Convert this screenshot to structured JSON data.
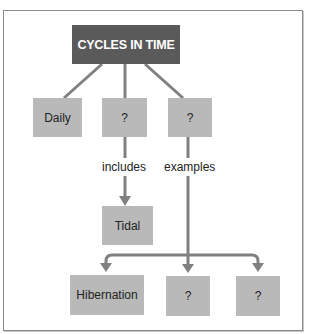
{
  "diagram": {
    "title": "CYCLES IN TIME",
    "colors": {
      "title_fill": "#5a5a5a",
      "title_text": "#ffffff",
      "node_fill": "#b9b9b9",
      "node_text": "#222222",
      "connector": "#808080",
      "frame_border": "#8a8a8a"
    },
    "level1": [
      {
        "label": "Daily"
      },
      {
        "label": "?"
      },
      {
        "label": "?"
      }
    ],
    "links": {
      "includes": "includes",
      "examples": "examples"
    },
    "includes_child": {
      "label": "Tidal"
    },
    "examples_children": [
      {
        "label": "Hibernation"
      },
      {
        "label": "?"
      },
      {
        "label": "?"
      }
    ]
  }
}
